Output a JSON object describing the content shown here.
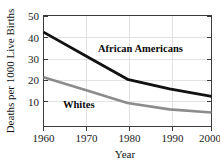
{
  "chart_data": {
    "type": "line",
    "title": "",
    "xlabel": "Year",
    "ylabel": "Deaths per 1000 Live Births",
    "x": [
      1960,
      1970,
      1980,
      1990,
      2000
    ],
    "xticklabels": [
      "1960",
      "1970",
      "1980",
      "1990",
      "2000"
    ],
    "yticks": [
      10,
      20,
      30,
      40,
      50
    ],
    "yticklabels": [
      "10",
      "20",
      "30",
      "40",
      "50"
    ],
    "xlim": [
      1960,
      2000
    ],
    "ylim": [
      0,
      52
    ],
    "grid": "vertical-only",
    "legend_position": "inline-annotations",
    "series": [
      {
        "name": "African Americans",
        "color": "#111111",
        "values": [
          44,
          33,
          22,
          17.5,
          14
        ],
        "label_x": 1982,
        "label_y": 34
      },
      {
        "name": "Whites",
        "color": "#8c8c8c",
        "values": [
          23,
          17,
          11,
          8,
          6.5
        ],
        "label_x": 1971,
        "label_y": 12
      }
    ],
    "annotations": [
      {
        "text": "African Americans"
      },
      {
        "text": "Whites"
      }
    ]
  },
  "axes": {
    "y_axis_title": "Deaths per 1000 Live Births",
    "x_axis_title": "Year",
    "y_tick_0": "10",
    "y_tick_1": "20",
    "y_tick_2": "30",
    "y_tick_3": "40",
    "y_tick_4": "50",
    "x_tick_0": "1960",
    "x_tick_1": "1970",
    "x_tick_2": "1980",
    "x_tick_3": "1990",
    "x_tick_4": "2000"
  },
  "labels": {
    "series_black": "African Americans",
    "series_gray": "Whites"
  },
  "colors": {
    "background": "#ffffff",
    "frame": "#3a3a3a",
    "grid": "#e2e2e2",
    "series_black": "#111111",
    "series_gray": "#8c8c8c",
    "text": "#111111"
  }
}
